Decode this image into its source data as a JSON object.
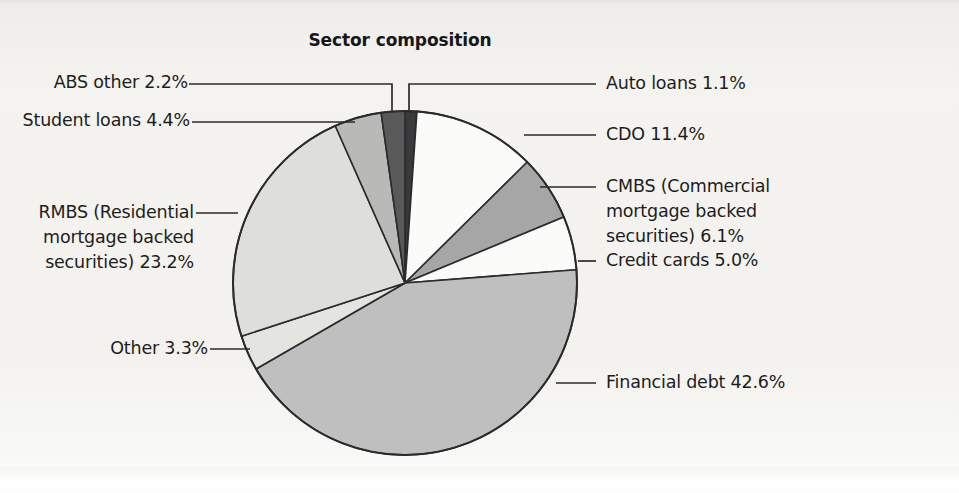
{
  "chart_data": {
    "type": "pie",
    "title": "Sector composition",
    "xlabel": "",
    "ylabel": "",
    "units": "percent",
    "legend_position": "callout-labels",
    "grid": false,
    "start_angle_deg": 0,
    "direction": "clockwise",
    "categories": [
      "Auto loans",
      "CDO",
      "CMBS (Commercial mortgage backed securities)",
      "Credit cards",
      "Financial debt",
      "Other",
      "RMBS (Residential mortgage backed securities)",
      "Student loans",
      "ABS other"
    ],
    "values": [
      1.1,
      11.4,
      6.1,
      5.0,
      42.6,
      3.3,
      23.2,
      4.4,
      2.2
    ],
    "slices": [
      {
        "name": "Auto loans",
        "value": 1.1,
        "label": "Auto loans 1.1%",
        "color": "#3a3a3c"
      },
      {
        "name": "CDO",
        "value": 11.4,
        "label": "CDO 11.4%",
        "color": "#fbfbf9"
      },
      {
        "name": "CMBS",
        "value": 6.1,
        "label": "CMBS (Commercial\nmortgage backed\nsecurities) 6.1%",
        "color": "#a6a6a6"
      },
      {
        "name": "Credit cards",
        "value": 5.0,
        "label": "Credit cards 5.0%",
        "color": "#fbfbf9"
      },
      {
        "name": "Financial debt",
        "value": 42.6,
        "label": "Financial debt 42.6%",
        "color": "#bfbfbf"
      },
      {
        "name": "Other",
        "value": 3.3,
        "label": "Other 3.3%",
        "color": "#e4e4e1"
      },
      {
        "name": "RMBS",
        "value": 23.2,
        "label": "RMBS (Residential\nmortgage backed\nsecurities) 23.2%",
        "color": "#dededa"
      },
      {
        "name": "Student loans",
        "value": 4.4,
        "label": "Student loans 4.4%",
        "color": "#b9b9b7"
      },
      {
        "name": "ABS other",
        "value": 2.2,
        "label": "ABS other 2.2%",
        "color": "#595959"
      }
    ]
  },
  "title": {
    "text": "Sector composition"
  },
  "labels": {
    "abs_other": "ABS other 2.2%",
    "student_loans": "Student loans 4.4%",
    "rmbs": "RMBS (Residential\nmortgage backed\nsecurities) 23.2%",
    "other": "Other 3.3%",
    "auto_loans": "Auto loans 1.1%",
    "cdo": "CDO 11.4%",
    "cmbs": "CMBS (Commercial\nmortgage backed\nsecurities) 6.1%",
    "credit_cards": "Credit cards 5.0%",
    "financial_debt": "Financial debt 42.6%"
  },
  "colors": {
    "background": "#f2f1ed",
    "outline": "#2b2b2e",
    "text": "#1d1d20"
  }
}
